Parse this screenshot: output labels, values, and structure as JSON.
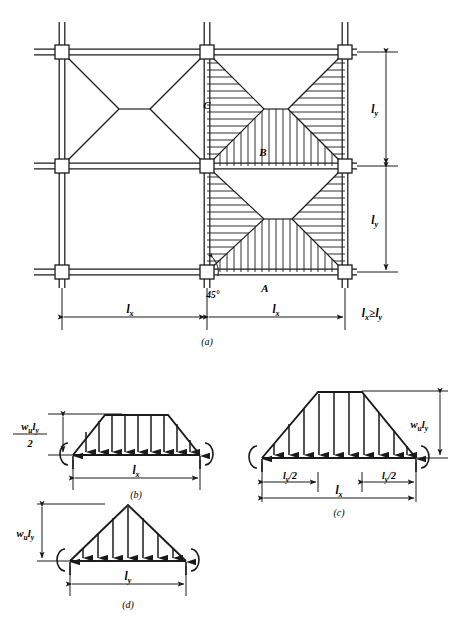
{
  "figure": {
    "caption_a": "(a)",
    "caption_b": "(b)",
    "caption_c": "(c)",
    "caption_d": "(d)",
    "ink_color": "#1a1a1a",
    "background": "#ffffff"
  },
  "plan": {
    "region_label_A": "A",
    "region_label_B": "B",
    "region_label_C": "C",
    "angle_label": "45°",
    "dim_bottom_left": "l",
    "dim_bottom_left_sub": "x",
    "dim_bottom_right": "l",
    "dim_bottom_right_sub": "x",
    "dim_right_top": "l",
    "dim_right_top_sub": "y",
    "dim_right_bottom": "l",
    "dim_right_bottom_sub": "y",
    "inequality_lhs": "l",
    "inequality_lhs_sub": "x",
    "inequality_op": "≥",
    "inequality_rhs": "l",
    "inequality_rhs_sub": "y"
  },
  "diagram_b": {
    "load_label_num": "w",
    "load_label_num_sub": "u",
    "load_label_num2": "l",
    "load_label_num2_sub": "y",
    "load_label_den": "2",
    "span_label": "l",
    "span_label_sub": "x",
    "shape": "trapezoidal",
    "arrow_count": 9
  },
  "diagram_c": {
    "load_label": "w",
    "load_label_sub": "u",
    "load_label2": "l",
    "load_label2_sub": "y",
    "half_left_label": "l",
    "half_left_sub": "y",
    "half_left_div": "/2",
    "half_right_label": "l",
    "half_right_sub": "y",
    "half_right_div": "/2",
    "span_label": "l",
    "span_label_sub": "x",
    "shape": "trapezoidal",
    "arrow_count": 10
  },
  "diagram_d": {
    "load_label": "w",
    "load_label_sub": "u",
    "load_label2": "l",
    "load_label2_sub": "y",
    "span_label": "l",
    "span_label_sub": "y",
    "shape": "triangular",
    "arrow_count": 7
  }
}
